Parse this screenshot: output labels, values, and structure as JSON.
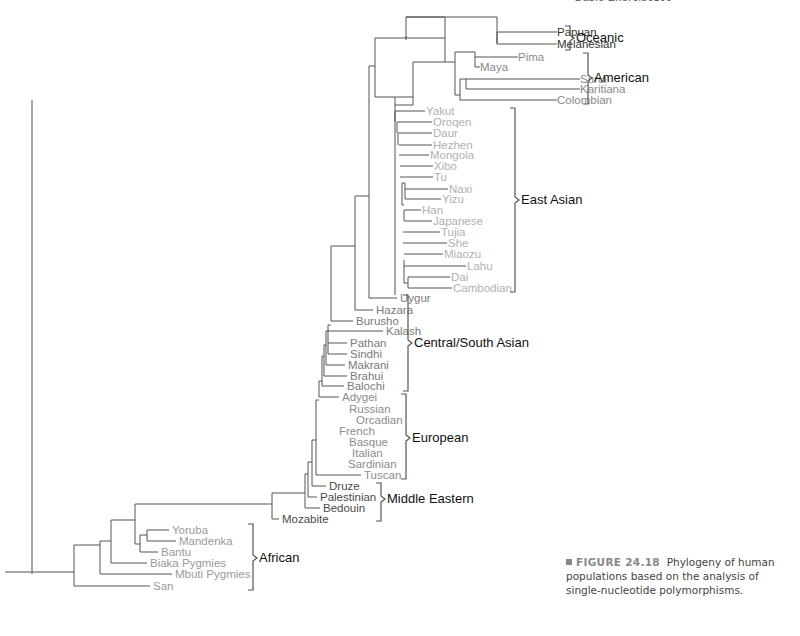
{
  "header": {
    "running_head": "Basic Exercises",
    "page_number": "699"
  },
  "caption": {
    "figure_number": "FIGURE 24.18",
    "text": "Phylogeny of human populations based on the analysis of single-nucleotide polymorphisms."
  },
  "colors": {
    "branch": "#555555",
    "oceanic": "#333333",
    "american": "#8a8a8a",
    "east_asian": "#b0b0b0",
    "central_south_asian": "#7a7a7a",
    "european": "#8c8c8c",
    "middle_eastern": "#4a4a4a",
    "african": "#9a9a9a",
    "bracket": "#555555"
  },
  "groups": [
    {
      "name": "Oceanic",
      "color_key": "oceanic",
      "y_top": 26,
      "y_bottom": 50,
      "bracket_x": 570,
      "label_y": 42
    },
    {
      "name": "American",
      "color_key": "american",
      "y_top": 53,
      "y_bottom": 104,
      "bracket_x": 588,
      "label_y": 82
    },
    {
      "name": "East Asian",
      "color_key": "east_asian",
      "y_top": 108,
      "y_bottom": 292,
      "bracket_x": 515,
      "label_y": 204
    },
    {
      "name": "Central/South Asian",
      "color_key": "central_south_asian",
      "y_top": 295,
      "y_bottom": 391,
      "bracket_x": 408,
      "label_y": 347
    },
    {
      "name": "European",
      "color_key": "european",
      "y_top": 394,
      "y_bottom": 479,
      "bracket_x": 406,
      "label_y": 442
    },
    {
      "name": "Middle Eastern",
      "color_key": "middle_eastern",
      "y_top": 483,
      "y_bottom": 521,
      "bracket_x": 381,
      "label_y": 503
    },
    {
      "name": "African",
      "color_key": "african",
      "y_top": 524,
      "y_bottom": 590,
      "bracket_x": 253,
      "label_y": 562
    }
  ],
  "leaves": [
    {
      "name": "Papuan",
      "y": 32,
      "x": 557,
      "color_key": "oceanic",
      "anchor": "end"
    },
    {
      "name": "Melanesian",
      "y": 44,
      "x": 557,
      "color_key": "oceanic",
      "anchor": "end"
    },
    {
      "name": "Pima",
      "y": 57,
      "x": 518,
      "color_key": "american",
      "anchor": "end"
    },
    {
      "name": "Maya",
      "y": 67,
      "x": 480,
      "color_key": "american",
      "anchor": "end"
    },
    {
      "name": "Surui",
      "y": 79,
      "x": 580,
      "color_key": "american",
      "anchor": "end"
    },
    {
      "name": "Karitiana",
      "y": 89,
      "x": 580,
      "color_key": "american",
      "anchor": "end"
    },
    {
      "name": "Colombian",
      "y": 100,
      "x": 557,
      "color_key": "american",
      "anchor": "end"
    },
    {
      "name": "Yakut",
      "y": 111,
      "x": 425,
      "color_key": "east_asian"
    },
    {
      "name": "Oroqen",
      "y": 122,
      "x": 432,
      "color_key": "east_asian"
    },
    {
      "name": "Daur",
      "y": 133,
      "x": 432,
      "color_key": "east_asian"
    },
    {
      "name": "Hezhen",
      "y": 145,
      "x": 432,
      "color_key": "east_asian"
    },
    {
      "name": "Mongola",
      "y": 155,
      "x": 429,
      "color_key": "east_asian"
    },
    {
      "name": "Xibo",
      "y": 166,
      "x": 433,
      "color_key": "east_asian"
    },
    {
      "name": "Tu",
      "y": 177,
      "x": 433,
      "color_key": "east_asian"
    },
    {
      "name": "Naxi",
      "y": 189,
      "x": 448,
      "color_key": "east_asian"
    },
    {
      "name": "Yizu",
      "y": 199,
      "x": 441,
      "color_key": "east_asian"
    },
    {
      "name": "Han",
      "y": 210,
      "x": 421,
      "color_key": "east_asian"
    },
    {
      "name": "Japanese",
      "y": 221,
      "x": 432,
      "color_key": "east_asian"
    },
    {
      "name": "Tujia",
      "y": 232,
      "x": 440,
      "color_key": "east_asian"
    },
    {
      "name": "She",
      "y": 243,
      "x": 447,
      "color_key": "east_asian"
    },
    {
      "name": "Miaozu",
      "y": 254,
      "x": 443,
      "color_key": "east_asian"
    },
    {
      "name": "Lahu",
      "y": 266,
      "x": 466,
      "color_key": "east_asian"
    },
    {
      "name": "Dai",
      "y": 277,
      "x": 450,
      "color_key": "east_asian"
    },
    {
      "name": "Cambodian",
      "y": 288,
      "x": 452,
      "color_key": "east_asian"
    },
    {
      "name": "Uygur",
      "y": 298,
      "x": 399,
      "color_key": "central_south_asian"
    },
    {
      "name": "Hazara",
      "y": 310,
      "x": 375,
      "color_key": "central_south_asian"
    },
    {
      "name": "Burusho",
      "y": 321,
      "x": 355,
      "color_key": "central_south_asian"
    },
    {
      "name": "Kalash",
      "y": 331,
      "x": 385,
      "color_key": "central_south_asian"
    },
    {
      "name": "Pathan",
      "y": 343,
      "x": 349,
      "color_key": "central_south_asian"
    },
    {
      "name": "Sindhi",
      "y": 354,
      "x": 349,
      "color_key": "central_south_asian"
    },
    {
      "name": "Makrani",
      "y": 365,
      "x": 347,
      "color_key": "central_south_asian"
    },
    {
      "name": "Brahui",
      "y": 376,
      "x": 349,
      "color_key": "central_south_asian"
    },
    {
      "name": "Balochi",
      "y": 386,
      "x": 346,
      "color_key": "central_south_asian"
    },
    {
      "name": "Adygei",
      "y": 397,
      "x": 341,
      "color_key": "european"
    },
    {
      "name": "Russian",
      "y": 409,
      "x": 348,
      "color_key": "european"
    },
    {
      "name": "Orcadian",
      "y": 420,
      "x": 355,
      "color_key": "european"
    },
    {
      "name": "French",
      "y": 431,
      "x": 338,
      "color_key": "european"
    },
    {
      "name": "Basque",
      "y": 442,
      "x": 348,
      "color_key": "european"
    },
    {
      "name": "Italian",
      "y": 453,
      "x": 351,
      "color_key": "european"
    },
    {
      "name": "Sardinian",
      "y": 464,
      "x": 347,
      "color_key": "european"
    },
    {
      "name": "Tuscan",
      "y": 475,
      "x": 363,
      "color_key": "european"
    },
    {
      "name": "Druze",
      "y": 486,
      "x": 328,
      "color_key": "middle_eastern"
    },
    {
      "name": "Palestinian",
      "y": 497,
      "x": 319,
      "color_key": "middle_eastern"
    },
    {
      "name": "Bedouin",
      "y": 508,
      "x": 322,
      "color_key": "middle_eastern"
    },
    {
      "name": "Mozabite",
      "y": 519,
      "x": 281,
      "color_key": "middle_eastern"
    },
    {
      "name": "Yoruba",
      "y": 530,
      "x": 171,
      "color_key": "african"
    },
    {
      "name": "Mandenka",
      "y": 541,
      "x": 178,
      "color_key": "african"
    },
    {
      "name": "Bantu",
      "y": 552,
      "x": 160,
      "color_key": "african"
    },
    {
      "name": "Biaka Pygmies",
      "y": 563,
      "x": 149,
      "color_key": "african"
    },
    {
      "name": "Mbuti Pygmies",
      "y": 574,
      "x": 174,
      "color_key": "african"
    },
    {
      "name": "San",
      "y": 586,
      "x": 152,
      "color_key": "african"
    }
  ],
  "branches": [
    [
      32,
      574,
      32,
      100,
      32,
      100,
      62
    ],
    [
      5,
      572,
      74,
      572
    ],
    [
      74,
      545,
      74,
      586
    ],
    [
      74,
      586,
      150,
      586
    ],
    [
      74,
      545,
      100,
      545
    ],
    [
      100,
      541,
      100,
      574
    ],
    [
      100,
      574,
      172,
      574
    ],
    [
      100,
      541,
      111,
      541
    ],
    [
      111,
      520,
      111,
      563
    ],
    [
      111,
      563,
      147,
      563
    ],
    [
      111,
      520,
      135,
      520
    ],
    [
      135,
      504,
      135,
      544
    ],
    [
      135,
      504,
      272,
      504
    ],
    [
      135,
      544,
      140,
      544
    ],
    [
      140,
      535,
      140,
      552
    ],
    [
      140,
      552,
      158,
      552
    ],
    [
      140,
      535,
      147,
      535
    ],
    [
      147,
      530,
      147,
      541
    ],
    [
      147,
      530,
      169,
      530
    ],
    [
      147,
      541,
      176,
      541
    ],
    [
      272,
      493,
      272,
      519
    ],
    [
      272,
      519,
      279,
      519
    ],
    [
      272,
      493,
      305,
      493
    ],
    [
      305,
      474,
      305,
      508
    ],
    [
      305,
      508,
      320,
      508
    ],
    [
      305,
      474,
      308,
      474
    ],
    [
      308,
      462,
      308,
      497
    ],
    [
      308,
      497,
      317,
      497
    ],
    [
      308,
      462,
      312,
      462
    ],
    [
      312,
      440,
      312,
      486
    ],
    [
      312,
      486,
      326,
      486
    ],
    [
      312,
      440,
      316,
      440
    ],
    [
      316,
      400,
      316,
      475
    ],
    [
      316,
      475,
      361,
      475
    ],
    [
      316,
      400,
      319,
      400
    ],
    [
      319,
      381,
      319,
      397
    ],
    [
      319,
      397,
      339,
      397
    ],
    [
      319,
      381,
      322,
      381
    ],
    [
      322,
      356,
      322,
      386
    ],
    [
      322,
      386,
      344,
      386
    ],
    [
      322,
      356,
      324,
      356
    ],
    [
      324,
      345,
      324,
      376
    ],
    [
      324,
      376,
      347,
      376
    ],
    [
      324,
      345,
      326,
      345
    ],
    [
      326,
      331,
      326,
      365
    ],
    [
      326,
      365,
      345,
      365
    ],
    [
      326,
      331,
      328,
      331
    ],
    [
      328,
      325,
      328,
      354
    ],
    [
      328,
      343,
      347,
      343
    ],
    [
      328,
      354,
      347,
      354
    ],
    [
      328,
      331,
      383,
      331
    ],
    [
      328,
      325,
      331,
      325
    ],
    [
      331,
      246,
      331,
      321
    ],
    [
      331,
      321,
      353,
      321
    ],
    [
      331,
      246,
      355,
      246
    ],
    [
      355,
      196,
      355,
      310
    ],
    [
      355,
      310,
      373,
      310
    ],
    [
      355,
      196,
      369,
      196
    ],
    [
      369,
      66,
      369,
      298
    ],
    [
      369,
      298,
      397,
      298
    ],
    [
      369,
      66,
      375,
      66
    ],
    [
      375,
      38,
      375,
      97
    ],
    [
      375,
      38,
      406,
      38
    ],
    [
      406,
      36,
      406,
      40
    ]
  ]
}
